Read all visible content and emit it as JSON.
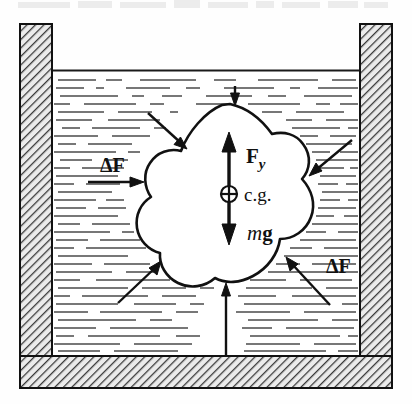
{
  "figure": {
    "colors": {
      "ink": "#111111",
      "wall_hatch": "#3a3a3a",
      "wall_fill": "#e8e8e8",
      "water_dash": "#4a4a4a",
      "body_fill": "#ffffff",
      "background": "#fefefe"
    }
  },
  "container": {
    "left_wall_label": "container-left-wall",
    "right_wall_label": "container-right-wall",
    "floor_label": "container-floor",
    "water_surface_label": "water-surface-line"
  },
  "labels": {
    "buoyant_force": {
      "symbol": "F",
      "subscript": "y"
    },
    "weight": {
      "mass": "m",
      "gravity": "g"
    },
    "center_of_gravity": "c.g.",
    "pressure_left": "ΔF",
    "pressure_right": "ΔF"
  },
  "arrows": [
    {
      "name": "pressure-arrow-top",
      "direction": "down",
      "label": ""
    },
    {
      "name": "pressure-arrow-top-left",
      "direction": "down-right",
      "label": ""
    },
    {
      "name": "pressure-arrow-top-right",
      "direction": "down-left",
      "label": ""
    },
    {
      "name": "pressure-arrow-left",
      "direction": "right",
      "label": "ΔF"
    },
    {
      "name": "pressure-arrow-bottom-left",
      "direction": "up-right",
      "label": ""
    },
    {
      "name": "pressure-arrow-bottom",
      "direction": "up",
      "label": ""
    },
    {
      "name": "pressure-arrow-bottom-right",
      "direction": "up-left",
      "label": "ΔF"
    },
    {
      "name": "buoyant-force-arrow",
      "direction": "up",
      "label": "F_y"
    },
    {
      "name": "weight-arrow",
      "direction": "down",
      "label": "mg"
    }
  ]
}
